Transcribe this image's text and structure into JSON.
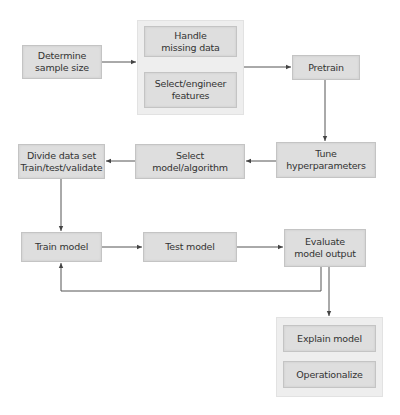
{
  "diagram": {
    "type": "flowchart",
    "colors": {
      "node_fill": "#dedede",
      "node_border": "#c4c4c4",
      "group_fill": "#eeeeee",
      "line": "#444444",
      "text": "#333333"
    },
    "nodes": {
      "determine": "Determine\nsample size",
      "handle_missing": "Handle\nmissing data",
      "select_features": "Select/engineer\nfeatures",
      "pretrain": "Pretrain",
      "tune": "Tune\nhyperparameters",
      "select_model": "Select\nmodel/algorithm",
      "divide": "Divide data set\nTrain/test/validate",
      "train": "Train model",
      "test": "Test model",
      "evaluate": "Evaluate\nmodel output",
      "explain": "Explain model",
      "operationalize": "Operationalize"
    },
    "groups": [
      {
        "id": "preprocessing",
        "members": [
          "handle_missing",
          "select_features"
        ]
      },
      {
        "id": "deployment",
        "members": [
          "explain",
          "operationalize"
        ]
      }
    ],
    "edges": [
      {
        "from": "determine",
        "to": "preprocessing"
      },
      {
        "from": "preprocessing",
        "to": "pretrain"
      },
      {
        "from": "pretrain",
        "to": "tune"
      },
      {
        "from": "tune",
        "to": "select_model"
      },
      {
        "from": "select_model",
        "to": "divide"
      },
      {
        "from": "divide",
        "to": "train"
      },
      {
        "from": "train",
        "to": "test"
      },
      {
        "from": "test",
        "to": "evaluate"
      },
      {
        "from": "evaluate",
        "to": "train",
        "kind": "feedback-loop"
      },
      {
        "from": "evaluate",
        "to": "deployment"
      }
    ]
  }
}
